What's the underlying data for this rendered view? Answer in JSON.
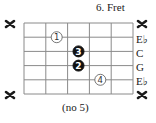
{
  "chord_diagram": {
    "title": "6. Fret",
    "footer": "(no 5)",
    "grid": {
      "left": 24,
      "top": 23,
      "right": 133,
      "bottom": 94,
      "frets_shown": 5,
      "strings": 6,
      "line_color": "#8a8a8a"
    },
    "strings": [
      {
        "index": 1,
        "left_marker": "x",
        "right_label": "x",
        "muted": true
      },
      {
        "index": 2,
        "left_marker": "",
        "right_label": "E♭",
        "muted": false
      },
      {
        "index": 3,
        "left_marker": "",
        "right_label": "C",
        "muted": false
      },
      {
        "index": 4,
        "left_marker": "",
        "right_label": "G",
        "muted": false
      },
      {
        "index": 5,
        "left_marker": "",
        "right_label": "E♭",
        "muted": false
      },
      {
        "index": 6,
        "left_marker": "x",
        "right_label": "x",
        "muted": true
      }
    ],
    "fingerings": [
      {
        "finger": "1",
        "string_row": 2,
        "fret_col": 2,
        "style": "outline"
      },
      {
        "finger": "3",
        "string_row": 3,
        "fret_col": 3,
        "style": "filled"
      },
      {
        "finger": "2",
        "string_row": 4,
        "fret_col": 3,
        "style": "filled"
      },
      {
        "finger": "4",
        "string_row": 5,
        "fret_col": 4,
        "style": "outline"
      }
    ],
    "colors": {
      "ink": "#1a1a1a",
      "filled_dot": "#111111",
      "outline_dot_stroke": "#555555",
      "background": "#ffffff"
    }
  }
}
